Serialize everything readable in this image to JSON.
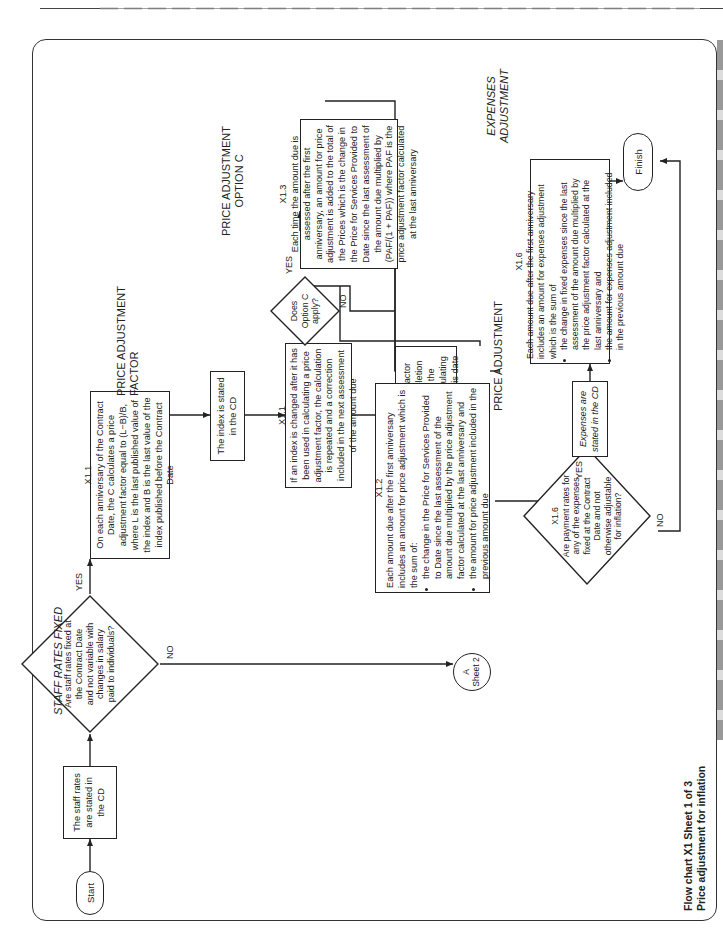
{
  "page": {
    "caption_line1": "Flow chart X1 Sheet 1 of 3",
    "caption_line2": "Price adjustment for inflation"
  },
  "section_labels": {
    "staff_rates_fixed": "STAFF RATES FIXED",
    "price_adjustment_factor": "PRICE ADJUSTMENT FACTOR",
    "price_adjustment_option_c": "PRICE ADJUSTMENT OPTION C",
    "price_adjustment": "PRICE ADJUSTMENT",
    "expenses_adjustment": "EXPENSES ADJUSTMENT"
  },
  "nodes": {
    "start": {
      "label": "Start"
    },
    "staff_rates_stated": {
      "label": "The staff rates are stated in the CD"
    },
    "staff_rates_decision": {
      "label": "Are staff rates fixed at the Contract Date and not variable with changes in salary paid to individuals?"
    },
    "sheet2_connector": {
      "label_line1": "A",
      "label_line2": "Sheet 2"
    },
    "paf_calc": {
      "ref": "X1.1",
      "text": "On each anniversary of the Contract Date, the C calculates a price adjustment factor equal to (L−B)/B, where L is the last published value of the index and B is the last value of the index published before the Contract Date"
    },
    "index_stated": {
      "label": "The index is stated in the CD"
    },
    "index_changed": {
      "ref": "X1.1",
      "text": "If an index is changed after it has been used in calculating a price adjustment factor, the calculation is repeated and a correction included in the next assessment of the amount due"
    },
    "completion_paf": {
      "ref": "X1.1",
      "text": "The price adjustment factor calculated at the Completion Date for the whole of the services is used for calculating price adjustment after this date"
    },
    "option_c_decision": {
      "label": "Does Option C apply?"
    },
    "option_c_box": {
      "ref": "X1.3",
      "text": "Each time the amount due is assessed after the first anniversary, an amount for price adjustment is added to the total of the Prices which is the change in the Price for Services Provided to Date since the last assessment of the amount due multiplied by (PAF/(1 + PAF)) where PAF is the price adjustment factor calculated at the last anniversary"
    },
    "price_adjustment_box": {
      "ref": "X1.2",
      "intro": "Each amount due after the first anniversary includes an amount for price adjustment which is the sum of:",
      "bullets": [
        "the change in the Price for Services Provided to Date since the last assessment of the amount due multiplied by the price adjustment factor calculated at the last anniversary and",
        "the amount for price adjustment included in the previous amount due"
      ]
    },
    "expenses_decision": {
      "ref": "X1.6",
      "label": "Are payment rates for any of the expenses fixed at the Contract Date and not otherwise adjustable for inflation?"
    },
    "expenses_stated": {
      "label": "Expenses are stated in the CD"
    },
    "expenses_box": {
      "ref": "X1.6",
      "intro": "Each amount due after the first anniversary includes an amount for expenses adjustment which is the sum of",
      "bullets": [
        "the change in fixed expenses since the last assessment of the amount due multiplied by the price adjustment factor calculated at the last anniversary and",
        "the amount for expenses adjustment included in the previous amount due"
      ]
    },
    "finish": {
      "label": "Finish"
    }
  },
  "branch_labels": {
    "yes": "YES",
    "no": "NO"
  },
  "colors": {
    "line": "#222222",
    "background": "#ffffff"
  }
}
